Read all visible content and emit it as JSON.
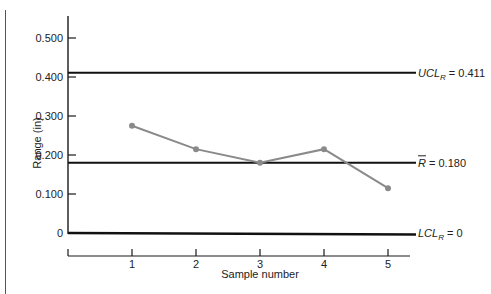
{
  "chart_data": {
    "type": "line",
    "title": "",
    "xlabel": "Sample number",
    "ylabel": "Range (in)",
    "x": [
      1,
      2,
      3,
      4,
      5
    ],
    "categories": [
      "1",
      "2",
      "3",
      "4",
      "5"
    ],
    "series": [
      {
        "name": "Sample range",
        "values": [
          0.275,
          0.215,
          0.18,
          0.215,
          0.115
        ],
        "color": "#8a8a8a"
      }
    ],
    "reference_lines": [
      {
        "name": "UCL_R",
        "value": 0.411,
        "label_main": "UCL",
        "label_sub": "R",
        "label_value": "= 0.411"
      },
      {
        "name": "R_bar",
        "value": 0.18,
        "label_main": "R",
        "label_sub": "",
        "label_value": "= 0.180"
      },
      {
        "name": "LCL_R",
        "value": 0,
        "label_main": "LCL",
        "label_sub": "R",
        "label_value": "= 0"
      }
    ],
    "y_ticks": [
      0,
      0.1,
      0.2,
      0.3,
      0.4,
      0.5
    ],
    "y_tick_labels": [
      "0",
      "0.100",
      "0.200",
      "0.300",
      "0.400",
      "0.500"
    ],
    "ylim": [
      0,
      0.55
    ],
    "xlim": [
      0,
      5.3
    ],
    "grid": false,
    "legend": "none"
  }
}
